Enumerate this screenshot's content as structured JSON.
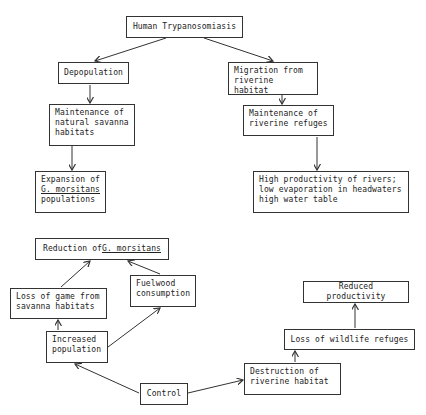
{
  "diagram": {
    "top": {
      "root": "Human Trypanosomiasis",
      "left_branch": [
        "Depopulation",
        "Maintenance of\nnatural savanna\nhabitats",
        "Expansion of\nG. morsitans\npopulations"
      ],
      "right_branch": [
        "Migration from\nriverine habitat",
        "Maintenance of\nriverine refuges",
        "High productivity of rivers;\nlow evaporation in headwaters\nhigh water table"
      ]
    },
    "bottom": {
      "reduction": "Reduction of G. morsitans",
      "loss_of_game": "Loss of game from\nsavanna habitats",
      "fuelwood": "Fuelwood\nconsumption",
      "increased_population": "Increased\npopulation",
      "control": "Control",
      "destruction": "Destruction of\nriverine habitat",
      "loss_of_refuges": "Loss of wildlife refuges",
      "reduced_productivity": "Reduced productivity"
    },
    "underlined_terms": [
      "G. morsitans"
    ]
  }
}
